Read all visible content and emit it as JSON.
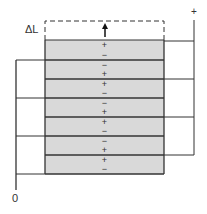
{
  "diagram": {
    "labels": {
      "delta_l": "ΔL",
      "positive_terminal": "+",
      "ground_terminal": "0"
    },
    "colors": {
      "layer_fill": "#d9d9d9",
      "line": "#333333",
      "background": "#ffffff"
    },
    "stack": {
      "x": 45,
      "width": 119,
      "top": 40,
      "layer_boundaries": [
        40,
        60,
        79,
        98,
        117,
        136,
        155,
        174
      ],
      "layers": [
        {
          "top_sign": "+",
          "bottom_sign": "−"
        },
        {
          "top_sign": "−",
          "bottom_sign": "+"
        },
        {
          "top_sign": "+",
          "bottom_sign": "−"
        },
        {
          "top_sign": "−",
          "bottom_sign": "+"
        },
        {
          "top_sign": "+",
          "bottom_sign": "−"
        },
        {
          "top_sign": "−",
          "bottom_sign": "+"
        },
        {
          "top_sign": "+",
          "bottom_sign": "−"
        }
      ]
    },
    "expansion_box": {
      "x": 45,
      "y": 21,
      "width": 119,
      "height": 19,
      "style": "dashed"
    },
    "arrow": {
      "direction": "up",
      "x": 105,
      "y_from": 37,
      "y_to": 24
    },
    "positive_bus": {
      "x": 194,
      "y_top": 20,
      "y_bottom": 155,
      "connections_y": [
        41,
        79,
        117,
        155
      ]
    },
    "ground_bus": {
      "x": 16,
      "y_top": 60,
      "y_bottom": 190,
      "connections_y": [
        60,
        98,
        136,
        174
      ]
    }
  }
}
